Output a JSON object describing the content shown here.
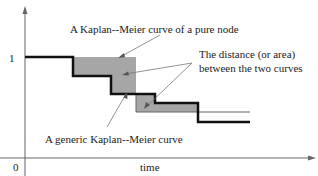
{
  "diagram": {
    "y_tick_label": "1",
    "origin_label": "0",
    "x_axis_label": "time",
    "annotations": {
      "pure_node": "A Kaplan--Meier curve of a pure node",
      "distance_line1": "The distance (or area)",
      "distance_line2": "between the two curves",
      "generic": "A generic Kaplan--Meier curve"
    },
    "colors": {
      "fill": "#a6a6a6",
      "curve": "#111111",
      "axis": "#555555"
    }
  }
}
